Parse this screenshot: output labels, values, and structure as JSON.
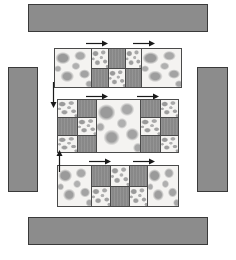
{
  "diagram": {
    "canvas": {
      "width": 236,
      "height": 260
    },
    "colors": {
      "border_strip_fill": "#8c8c8c",
      "border_strip_outline": "#3a3a3a",
      "dark_patch": "#8e8e8e",
      "light_floral_patch": "#f4f3f1",
      "seam_line": "#4a4a4a",
      "arrow": "#1a1a1a",
      "background": "#ffffff"
    },
    "border_strips": [
      {
        "name": "top-border-strip",
        "x": 28,
        "y": 4,
        "w": 180,
        "h": 28,
        "orientation": "horizontal"
      },
      {
        "name": "left-border-strip",
        "x": 8,
        "y": 67,
        "w": 30,
        "h": 125,
        "orientation": "vertical"
      },
      {
        "name": "right-border-strip",
        "x": 197,
        "y": 67,
        "w": 31,
        "h": 125,
        "orientation": "vertical"
      },
      {
        "name": "bottom-border-strip",
        "x": 28,
        "y": 217,
        "w": 180,
        "h": 28,
        "orientation": "horizontal"
      }
    ],
    "rows": [
      {
        "name": "top-row",
        "x": 54,
        "y": 48,
        "w": 128,
        "h": 40,
        "segments": [
          {
            "name": "plain-floral-block-left",
            "w": 36,
            "cols": 1,
            "rows": 1,
            "cells": [
              "floral"
            ]
          },
          {
            "name": "four-patch-checkerboard",
            "w": 50,
            "cols": 3,
            "rows": 2,
            "cells": [
              "floral",
              "solid",
              "floral",
              "solid",
              "floral",
              "solid"
            ]
          },
          {
            "name": "plain-floral-block-right",
            "w": 40,
            "cols": 1,
            "rows": 1,
            "cells": [
              "floral"
            ]
          }
        ]
      },
      {
        "name": "middle-row",
        "x": 57,
        "y": 99,
        "w": 122,
        "h": 54,
        "segments": [
          {
            "name": "left-checkerboard-unit",
            "w": 38,
            "cols": 2,
            "rows": 3,
            "cells": [
              "floral",
              "solid",
              "solid",
              "floral",
              "floral",
              "solid"
            ]
          },
          {
            "name": "center-large-floral-panel",
            "w": 44,
            "cols": 1,
            "rows": 1,
            "cells": [
              "floral"
            ]
          },
          {
            "name": "right-checkerboard-unit",
            "w": 38,
            "cols": 2,
            "rows": 3,
            "cells": [
              "solid",
              "floral",
              "floral",
              "solid",
              "solid",
              "floral"
            ]
          }
        ]
      },
      {
        "name": "bottom-row",
        "x": 57,
        "y": 165,
        "w": 122,
        "h": 42,
        "segments": [
          {
            "name": "plain-floral-block-left",
            "w": 33,
            "cols": 1,
            "rows": 1,
            "cells": [
              "floral"
            ]
          },
          {
            "name": "center-checkerboard",
            "w": 56,
            "cols": 3,
            "rows": 2,
            "cells": [
              "solid",
              "floral",
              "solid",
              "floral",
              "solid",
              "floral"
            ]
          },
          {
            "name": "plain-floral-block-right",
            "w": 31,
            "cols": 1,
            "rows": 1,
            "cells": [
              "floral"
            ]
          }
        ]
      }
    ],
    "arrows": [
      {
        "name": "press-arrow-top-left",
        "x": 86,
        "y": 39,
        "direction": "right",
        "length": 22
      },
      {
        "name": "press-arrow-top-right",
        "x": 133,
        "y": 39,
        "direction": "right",
        "length": 22
      },
      {
        "name": "press-arrow-middle-left",
        "x": 86,
        "y": 92,
        "direction": "right",
        "length": 22
      },
      {
        "name": "press-arrow-middle-right",
        "x": 137,
        "y": 92,
        "direction": "right",
        "length": 22
      },
      {
        "name": "press-arrow-bottom-left",
        "x": 89,
        "y": 157,
        "direction": "right",
        "length": 22
      },
      {
        "name": "press-arrow-bottom-right",
        "x": 133,
        "y": 157,
        "direction": "right",
        "length": 22
      },
      {
        "name": "press-arrow-side-down",
        "x": 49,
        "y": 82,
        "direction": "down",
        "length": 26
      },
      {
        "name": "press-arrow-side-up",
        "x": 55,
        "y": 150,
        "direction": "up",
        "length": 22
      }
    ]
  }
}
